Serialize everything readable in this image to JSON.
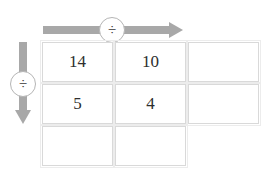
{
  "diagram": {
    "column_operator": {
      "name": "column-divide-arrow",
      "symbol": "÷",
      "direction": "right"
    },
    "row_operator": {
      "name": "row-divide-arrow",
      "symbol": "÷",
      "direction": "down"
    },
    "colors": {
      "arrow": "#a8a8a8",
      "cell_border": "#d9d9d9",
      "cell_outer_border": "#ececec",
      "text": "#2e2e2e",
      "background": "#ffffff"
    },
    "grid": {
      "columns": 3,
      "rows": 3,
      "cells": [
        [
          {
            "value": "14",
            "filled": true
          },
          {
            "value": "10",
            "filled": true
          },
          {
            "value": "",
            "filled": true
          }
        ],
        [
          {
            "value": "5",
            "filled": true
          },
          {
            "value": "4",
            "filled": true
          },
          {
            "value": "",
            "filled": true
          }
        ],
        [
          {
            "value": "",
            "filled": true
          },
          {
            "value": "",
            "filled": true
          },
          {
            "value": "",
            "filled": false
          }
        ]
      ]
    }
  }
}
